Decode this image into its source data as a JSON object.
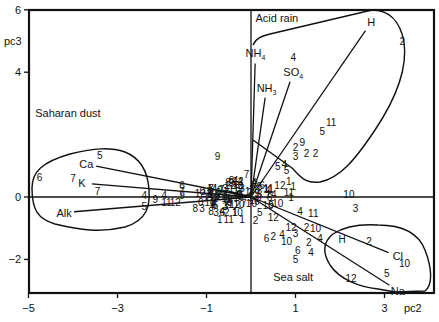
{
  "chart_data": {
    "type": "scatter",
    "subtype": "pca-biplot",
    "title": "",
    "xlabel": "pc2",
    "ylabel": "pc3",
    "xlim": [
      -5,
      4.1
    ],
    "ylim": [
      -3.07,
      6
    ],
    "grid": false,
    "legend": null,
    "xticks": [
      -5,
      -3,
      -1,
      1,
      3
    ],
    "yticks": [
      -2,
      0,
      4,
      6
    ],
    "xtick_labels": [
      "−5",
      "−3",
      "−1",
      "1",
      "3"
    ],
    "ytick_labels": [
      "−2",
      "0",
      "4",
      "6"
    ],
    "zero_lines": {
      "x": 0,
      "y": 0
    },
    "loadings": [
      {
        "name": "H",
        "label": "H",
        "x": 2.7,
        "y": 5.6
      },
      {
        "name": "NH4",
        "label": "NH",
        "sub": "4",
        "x": 0.1,
        "y": 4.6
      },
      {
        "name": "NH3",
        "label": "NH",
        "sub": "3",
        "x": 0.35,
        "y": 3.5
      },
      {
        "name": "SO4",
        "label": "SO",
        "sub": "4",
        "x": 0.95,
        "y": 4.0
      },
      {
        "name": "Mg",
        "label": "Mg",
        "x": -0.8,
        "y": 0.3
      },
      {
        "name": "Ca",
        "label": "Ca",
        "x": -3.7,
        "y": 1.05
      },
      {
        "name": "K",
        "label": "K",
        "x": -3.8,
        "y": 0.45
      },
      {
        "name": "Alk",
        "label": "Alk",
        "x": -4.2,
        "y": -0.5
      },
      {
        "name": "Cl",
        "label": "Cl",
        "x": 3.3,
        "y": -1.9
      },
      {
        "name": "Na",
        "label": "Na",
        "x": 3.3,
        "y": -3.0
      }
    ],
    "groups": [
      {
        "name": "Acid rain",
        "label_x": 0.1,
        "label_y": 5.6
      },
      {
        "name": "Saharan dust",
        "label_x": -4.85,
        "label_y": 2.55
      },
      {
        "name": "Sea salt",
        "label_x": 0.5,
        "label_y": -2.7
      }
    ],
    "samples": [
      {
        "label": "2",
        "x": 3.4,
        "y": 5.0
      },
      {
        "label": "4",
        "x": 0.95,
        "y": 4.5
      },
      {
        "label": "11",
        "x": 1.8,
        "y": 2.4
      },
      {
        "label": "5",
        "x": 1.6,
        "y": 2.1
      },
      {
        "label": "9",
        "x": 1.15,
        "y": 1.75
      },
      {
        "label": "2",
        "x": 1.0,
        "y": 1.6
      },
      {
        "label": "2",
        "x": 1.25,
        "y": 1.4
      },
      {
        "label": "2",
        "x": 1.45,
        "y": 1.4
      },
      {
        "label": "3",
        "x": 1.0,
        "y": 1.3
      },
      {
        "label": "5",
        "x": 0.6,
        "y": 1.0
      },
      {
        "label": "4",
        "x": 0.75,
        "y": 1.05
      },
      {
        "label": "5",
        "x": 0.8,
        "y": 0.85
      },
      {
        "label": "9",
        "x": -0.75,
        "y": 1.3
      },
      {
        "label": "7",
        "x": -0.1,
        "y": 0.75
      },
      {
        "label": "4",
        "x": -0.35,
        "y": 0.55
      },
      {
        "label": "10",
        "x": -0.3,
        "y": 0.4
      },
      {
        "label": "6",
        "x": 0.25,
        "y": 0.4
      },
      {
        "label": "12",
        "x": 0.65,
        "y": 0.4
      },
      {
        "label": "1",
        "x": 0.85,
        "y": 0.5
      },
      {
        "label": "1",
        "x": 0.95,
        "y": 0.35
      },
      {
        "label": "11",
        "x": 0.85,
        "y": 0.15
      },
      {
        "label": "5",
        "x": -3.4,
        "y": 1.35
      },
      {
        "label": "6",
        "x": -4.75,
        "y": 0.65
      },
      {
        "label": "7",
        "x": -4.0,
        "y": 0.6
      },
      {
        "label": "7",
        "x": -3.45,
        "y": 0.2
      },
      {
        "label": "4",
        "x": -2.4,
        "y": 0.05
      },
      {
        "label": "5",
        "x": -2.4,
        "y": -0.3
      },
      {
        "label": "9",
        "x": -2.15,
        "y": -0.05
      },
      {
        "label": "4",
        "x": -1.95,
        "y": 0.05
      },
      {
        "label": "11",
        "x": -1.9,
        "y": -0.15
      },
      {
        "label": "12",
        "x": -1.7,
        "y": -0.15
      },
      {
        "label": "6",
        "x": -1.55,
        "y": 0.4
      },
      {
        "label": "7",
        "x": -1.55,
        "y": 0.2
      },
      {
        "label": "9",
        "x": -1.55,
        "y": 0.05
      },
      {
        "label": "7",
        "x": -0.9,
        "y": 0.3
      },
      {
        "label": "10",
        "x": -0.8,
        "y": 0.15
      },
      {
        "label": "7",
        "x": -0.55,
        "y": 0.15
      },
      {
        "label": "3",
        "x": -0.2,
        "y": 0.3
      },
      {
        "label": "8",
        "x": -1.25,
        "y": -0.35
      },
      {
        "label": "3",
        "x": -1.1,
        "y": -0.35
      },
      {
        "label": "8",
        "x": -0.9,
        "y": -0.45
      },
      {
        "label": "1",
        "x": -0.7,
        "y": -0.7
      },
      {
        "label": "11",
        "x": -0.5,
        "y": -0.7
      },
      {
        "label": "1",
        "x": -0.2,
        "y": -0.7
      },
      {
        "label": "14",
        "x": 0.45,
        "y": 0.1
      },
      {
        "label": "1",
        "x": 0.9,
        "y": 0.0
      },
      {
        "label": "10",
        "x": 2.2,
        "y": 0.1
      },
      {
        "label": "3",
        "x": 2.35,
        "y": -0.35
      },
      {
        "label": "4",
        "x": 1.1,
        "y": -0.45
      },
      {
        "label": "11",
        "x": 1.4,
        "y": -0.5
      },
      {
        "label": "10",
        "x": 0.6,
        "y": -0.2
      },
      {
        "label": "12",
        "x": 0.5,
        "y": -0.65
      },
      {
        "label": "2",
        "x": 0.1,
        "y": -0.75
      },
      {
        "label": "12",
        "x": 0.9,
        "y": -0.95
      },
      {
        "label": "2",
        "x": 1.25,
        "y": -0.95
      },
      {
        "label": "10",
        "x": 1.45,
        "y": -1.0
      },
      {
        "label": "4",
        "x": 1.55,
        "y": -1.3
      },
      {
        "label": "6",
        "x": 0.35,
        "y": -1.3
      },
      {
        "label": "2",
        "x": 0.5,
        "y": -1.25
      },
      {
        "label": "4",
        "x": 0.7,
        "y": -1.2
      },
      {
        "label": "3",
        "x": 1.0,
        "y": -1.15
      },
      {
        "label": "10",
        "x": 0.8,
        "y": -1.4
      },
      {
        "label": "2",
        "x": 1.3,
        "y": -1.45
      },
      {
        "label": "4",
        "x": 1.35,
        "y": -1.75
      },
      {
        "label": "6",
        "x": 1.05,
        "y": -1.7
      },
      {
        "label": "5",
        "x": 1.0,
        "y": -2.0
      },
      {
        "label": "H",
        "x": 2.05,
        "y": -1.35
      },
      {
        "label": "2",
        "x": 2.65,
        "y": -1.4
      },
      {
        "label": "10",
        "x": 3.45,
        "y": -2.1
      },
      {
        "label": "5",
        "x": 3.05,
        "y": -2.45
      },
      {
        "label": "12",
        "x": 2.25,
        "y": -2.6
      }
    ],
    "cluster_points": {
      "count": 70,
      "center_x": -0.35,
      "center_y": -0.15,
      "spread_x": 0.55,
      "spread_y": 0.45
    }
  }
}
